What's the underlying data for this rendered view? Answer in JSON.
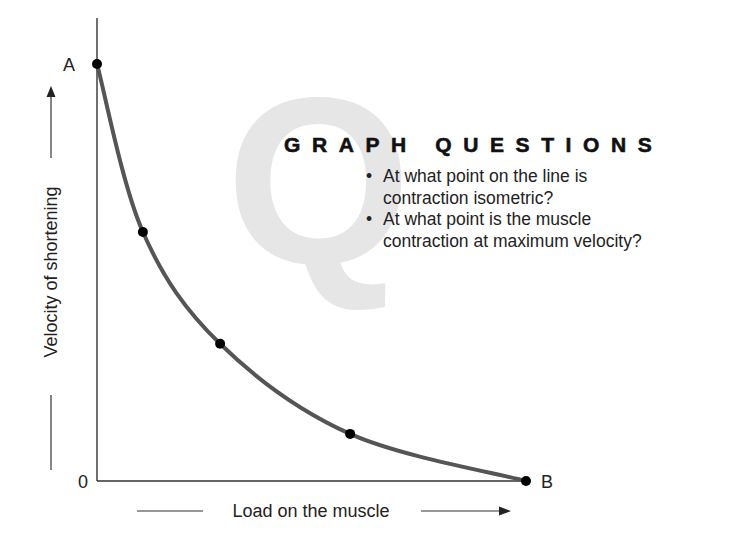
{
  "watermark": {
    "letter": "Q"
  },
  "questions": {
    "title": "GRAPH QUESTIONS",
    "items": [
      {
        "bullet": "•",
        "text_line1": "At what point on the line is",
        "text_line2": "contraction isometric?"
      },
      {
        "bullet": "•",
        "text_line1": "At what point is the muscle",
        "text_line2": "contraction at maximum velocity?"
      }
    ]
  },
  "colors": {
    "curve": "#555555",
    "points": "#000000",
    "axis": "#333333",
    "watermark": "#e6e6e6"
  },
  "chart_data": {
    "type": "line",
    "title": "",
    "xlabel": "Load on the muscle",
    "ylabel": "Velocity of shortening",
    "x_axis_direction_arrow": true,
    "y_axis_direction_arrow": true,
    "origin_label": "0",
    "xlim": [
      0,
      1
    ],
    "ylim": [
      0,
      1
    ],
    "grid": false,
    "legend": null,
    "series": [
      {
        "name": "Force-velocity curve",
        "x": [
          0,
          0.107,
          0.287,
          0.59,
          1.0
        ],
        "y": [
          1.0,
          0.597,
          0.329,
          0.113,
          0.0
        ],
        "point_labels": [
          "A",
          "",
          "",
          "",
          "B"
        ]
      }
    ],
    "annotations": [
      {
        "label": "A",
        "x": 0,
        "y": 1.0,
        "meaning": "maximum velocity, zero load"
      },
      {
        "label": "B",
        "x": 1.0,
        "y": 0,
        "meaning": "zero velocity (isometric)"
      }
    ]
  }
}
